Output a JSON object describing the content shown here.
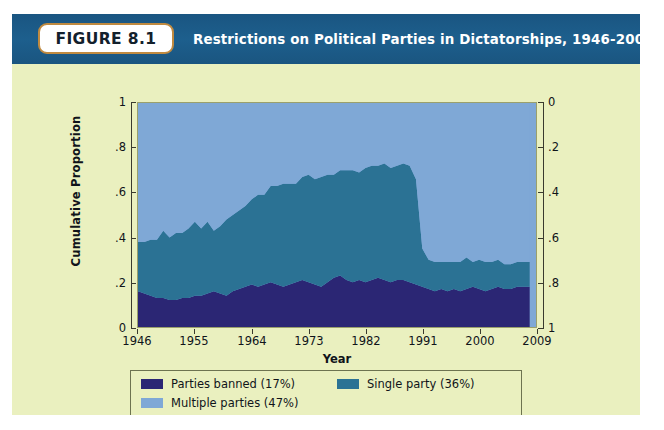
{
  "figure": {
    "badge_label": "FIGURE 8.1",
    "title": "Restrictions on Political Parties in Dictatorships, 1946-2008"
  },
  "colors": {
    "header_band": "#1b5a86",
    "badge_border": "#c08a40",
    "page_background": "#eaf0bf",
    "parties_banned": "#2b2674",
    "single_party": "#2b7294",
    "multiple_parties": "#7fa8d6"
  },
  "axes": {
    "y_left_title": "Cumulative Proportion",
    "y_left_ticks": [
      "0",
      ".2",
      ".4",
      ".6",
      ".8",
      "1"
    ],
    "y_right_ticks": [
      "0",
      ".2",
      ".4",
      ".6",
      ".8",
      "1"
    ],
    "x_title": "Year",
    "x_ticks": [
      "1946",
      "1955",
      "1964",
      "1973",
      "1982",
      "1991",
      "2000",
      "2009"
    ]
  },
  "legend": {
    "items": [
      {
        "label": "Parties banned (17%)",
        "color": "#2b2674"
      },
      {
        "label": "Single party (36%)",
        "color": "#2b7294"
      },
      {
        "label": "Multiple parties (47%)",
        "color": "#7fa8d6"
      }
    ]
  },
  "chart_data": {
    "type": "area",
    "stacked": true,
    "title": "Restrictions on Political Parties in Dictatorships, 1946-2008",
    "xlabel": "Year",
    "ylabel": "Cumulative Proportion",
    "xlim": [
      1946,
      2009
    ],
    "ylim": [
      0,
      1
    ],
    "grid": false,
    "legend_position": "bottom",
    "y_right_inverted": true,
    "x": [
      1946,
      1947,
      1948,
      1949,
      1950,
      1951,
      1952,
      1953,
      1954,
      1955,
      1956,
      1957,
      1958,
      1959,
      1960,
      1961,
      1962,
      1963,
      1964,
      1965,
      1966,
      1967,
      1968,
      1969,
      1970,
      1971,
      1972,
      1973,
      1974,
      1975,
      1976,
      1977,
      1978,
      1979,
      1980,
      1981,
      1982,
      1983,
      1984,
      1985,
      1986,
      1987,
      1988,
      1989,
      1990,
      1991,
      1992,
      1993,
      1994,
      1995,
      1996,
      1997,
      1998,
      1999,
      2000,
      2001,
      2002,
      2003,
      2004,
      2005,
      2006,
      2007,
      2008
    ],
    "series": [
      {
        "name": "Parties banned (17%)",
        "color": "#2b2674",
        "share_overall": 0.17,
        "values": [
          0.16,
          0.15,
          0.14,
          0.13,
          0.13,
          0.12,
          0.12,
          0.13,
          0.13,
          0.14,
          0.14,
          0.15,
          0.16,
          0.15,
          0.14,
          0.16,
          0.17,
          0.18,
          0.19,
          0.18,
          0.19,
          0.2,
          0.19,
          0.18,
          0.19,
          0.2,
          0.21,
          0.2,
          0.19,
          0.18,
          0.2,
          0.22,
          0.23,
          0.21,
          0.2,
          0.21,
          0.2,
          0.21,
          0.22,
          0.21,
          0.2,
          0.21,
          0.21,
          0.2,
          0.19,
          0.18,
          0.17,
          0.16,
          0.17,
          0.16,
          0.17,
          0.16,
          0.17,
          0.18,
          0.17,
          0.16,
          0.17,
          0.18,
          0.17,
          0.17,
          0.18,
          0.18,
          0.18
        ]
      },
      {
        "name": "Single party (36%)",
        "color": "#2b7294",
        "share_overall": 0.36,
        "values": [
          0.22,
          0.23,
          0.25,
          0.26,
          0.3,
          0.28,
          0.3,
          0.29,
          0.31,
          0.33,
          0.3,
          0.32,
          0.27,
          0.3,
          0.34,
          0.34,
          0.35,
          0.36,
          0.38,
          0.41,
          0.4,
          0.43,
          0.44,
          0.46,
          0.45,
          0.44,
          0.46,
          0.48,
          0.47,
          0.49,
          0.48,
          0.46,
          0.47,
          0.49,
          0.5,
          0.48,
          0.51,
          0.51,
          0.5,
          0.52,
          0.51,
          0.51,
          0.52,
          0.52,
          0.47,
          0.17,
          0.13,
          0.13,
          0.12,
          0.13,
          0.12,
          0.13,
          0.14,
          0.11,
          0.13,
          0.13,
          0.12,
          0.12,
          0.11,
          0.11,
          0.11,
          0.11,
          0.11
        ]
      },
      {
        "name": "Multiple parties (47%)",
        "color": "#7fa8d6",
        "share_overall": 0.47,
        "values": [
          0.62,
          0.62,
          0.61,
          0.61,
          0.57,
          0.6,
          0.58,
          0.58,
          0.56,
          0.53,
          0.56,
          0.53,
          0.57,
          0.55,
          0.52,
          0.5,
          0.48,
          0.46,
          0.43,
          0.41,
          0.41,
          0.37,
          0.37,
          0.36,
          0.36,
          0.36,
          0.33,
          0.32,
          0.34,
          0.33,
          0.32,
          0.32,
          0.3,
          0.3,
          0.3,
          0.31,
          0.29,
          0.28,
          0.28,
          0.27,
          0.29,
          0.28,
          0.27,
          0.28,
          0.34,
          0.65,
          0.7,
          0.71,
          0.71,
          0.71,
          0.71,
          0.71,
          0.69,
          0.71,
          0.7,
          0.71,
          0.71,
          0.7,
          0.72,
          0.72,
          0.71,
          0.71,
          0.71
        ]
      }
    ]
  }
}
